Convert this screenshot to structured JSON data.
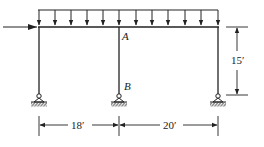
{
  "diagram": {
    "type": "rigid frame structure with distributed load",
    "colors": {
      "line": "#222222",
      "background": "#ffffff"
    },
    "labels": {
      "joint_a": "A",
      "support_b": "B",
      "height_dim": "15′",
      "span_left_dim": "18′",
      "span_right_dim": "20′"
    },
    "elements": {
      "beam": "horizontal beam spanning three columns",
      "columns": [
        "left-column",
        "middle-column",
        "right-column"
      ],
      "supports": [
        "pin-support-left",
        "pin-support-middle",
        "pin-support-right"
      ],
      "distributed_load": "uniform downward load along beam (12 arrows)",
      "horizontal_load": "point load applied horizontally at left end of beam"
    }
  }
}
